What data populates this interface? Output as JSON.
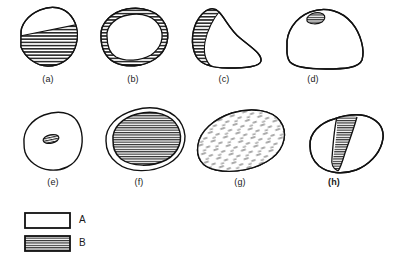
{
  "figure": {
    "background_color": "#ffffff",
    "outline_color": "#111111",
    "hatch_color": "#1a1a1a",
    "fill_color": "#ffffff"
  },
  "panels": [
    {
      "id": "a",
      "label": "(a)",
      "label_bold": false,
      "description": "Rounded quadrilateral outline; lower-right region filled with horizontal hatching (B) separated by a diagonal boundary, upper-left region unfilled (A)",
      "pattern": "horizontal-hatch",
      "b_region": "lower-diagonal-half"
    },
    {
      "id": "b",
      "label": "(b)",
      "label_bold": false,
      "description": "Oval outline forming a closed ring; the full perimeter band is horizontally hatched (B) with an unfilled interior (A)",
      "pattern": "horizontal-hatch",
      "b_region": "perimeter-ring"
    },
    {
      "id": "c",
      "label": "(c)",
      "label_bold": false,
      "description": "Teardrop/heart-shaped outline with a narrow hatched band (B) along the left and lower-left margin, remainder unfilled (A)",
      "pattern": "horizontal-hatch",
      "b_region": "left-margin-band"
    },
    {
      "id": "d",
      "label": "(d)",
      "label_bold": false,
      "description": "Dome-shaped outline, almost entirely unfilled (A), with one very small hatched notch (B) at the upper-left crest",
      "pattern": "horizontal-hatch",
      "b_region": "small-crest-notch"
    },
    {
      "id": "e",
      "label": "(e)",
      "label_bold": false,
      "description": "Irregular rounded outline, unfilled (A), with a small hatched ellipse (B) near the centre",
      "pattern": "horizontal-hatch",
      "b_region": "small-central-ellipse"
    },
    {
      "id": "f",
      "label": "(f)",
      "label_bold": false,
      "description": "Oval outline with a thin unfilled rim (A) enclosing a large horizontally hatched core (B)",
      "pattern": "horizontal-hatch",
      "b_region": "large-central-core"
    },
    {
      "id": "g",
      "label": "(g)",
      "label_bold": false,
      "description": "Broad rounded outline entirely filled with short broken dashes (stipple/dash texture)",
      "pattern": "dash-stipple",
      "b_region": "whole-interior-dashed"
    },
    {
      "id": "h",
      "label": "(h)",
      "label_bold": true,
      "description": "Irregular elongated outline, unfilled (A), crossed by a vertical hatched band (B) left of centre",
      "pattern": "horizontal-hatch",
      "b_region": "vertical-central-band"
    }
  ],
  "legend": {
    "items": [
      {
        "key": "A",
        "label": "A",
        "swatch": "white-box",
        "description": "Unfilled white region"
      },
      {
        "key": "B",
        "label": "B",
        "swatch": "hatched-box",
        "description": "Horizontally hatched region"
      }
    ]
  }
}
